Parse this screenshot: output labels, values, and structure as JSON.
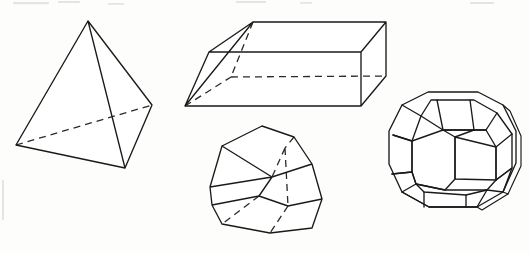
{
  "figure": {
    "background_color": "#fdfdfc",
    "stroke_color": "#1a1a1a",
    "canvas": {
      "width": 530,
      "height": 253
    },
    "caption": "",
    "shapes": [
      {
        "id": "tetrahedron",
        "name": "Tetrahedron",
        "label": "",
        "vertices": {
          "apex": [
            88,
            21
          ],
          "left": [
            16,
            145
          ],
          "right": [
            152,
            105
          ],
          "bottom_front": [
            125,
            168
          ]
        },
        "solid_edges": [
          [
            "apex",
            "left"
          ],
          [
            "apex",
            "right"
          ],
          [
            "apex",
            "bottom_front"
          ],
          [
            "left",
            "bottom_front"
          ],
          [
            "right",
            "bottom_front"
          ]
        ],
        "hidden_edges": [
          [
            "left",
            "right"
          ]
        ]
      },
      {
        "id": "parallelepiped",
        "name": "Oblique parallelepiped",
        "label": "",
        "vertices": {
          "front_top_left": [
            209,
            52
          ],
          "front_top_right": [
            361,
            52
          ],
          "front_bottom_left": [
            185,
            106
          ],
          "front_bottom_right": [
            361,
            106
          ],
          "back_top_left": [
            253,
            22
          ],
          "back_top_right": [
            386,
            22
          ],
          "back_bottom_left": [
            231,
            77
          ],
          "back_bottom_right": [
            386,
            76
          ]
        },
        "solid_edges": [
          [
            "front_top_left",
            "front_top_right"
          ],
          [
            "front_bottom_left",
            "front_bottom_right"
          ],
          [
            "front_top_left",
            "front_bottom_left"
          ],
          [
            "front_top_right",
            "front_bottom_right"
          ],
          [
            "back_top_left",
            "back_top_right"
          ],
          [
            "back_top_left",
            "front_top_left"
          ],
          [
            "back_top_right",
            "front_top_right"
          ],
          [
            "back_top_right",
            "back_bottom_right"
          ],
          [
            "back_bottom_right",
            "front_bottom_right"
          ],
          [
            "front_bottom_left",
            "back_top_left"
          ]
        ],
        "hidden_edges": [
          [
            "back_bottom_left",
            "back_bottom_right"
          ],
          [
            "back_top_left",
            "back_bottom_left"
          ],
          [
            "front_bottom_left",
            "back_bottom_left"
          ]
        ]
      },
      {
        "id": "dodecahedron",
        "name": "Irregular dodecahedron",
        "label": "",
        "vertices": {
          "top": [
            262,
            126
          ],
          "top_right": [
            294,
            137
          ],
          "upper_left": [
            222,
            146
          ],
          "mid_left": [
            210,
            187
          ],
          "right_upper": [
            312,
            164
          ],
          "right_mid": [
            322,
            199
          ],
          "center_mid": [
            272,
            177
          ],
          "left_low": [
            212,
            205
          ],
          "low_mid": [
            259,
            196
          ],
          "bottom_left": [
            222,
            224
          ],
          "bottom_mid": [
            270,
            233
          ],
          "bottom_right": [
            312,
            228
          ],
          "hidden_a": [
            285,
            148
          ],
          "hidden_b": [
            288,
            206
          ]
        },
        "solid_edges": [
          [
            "top",
            "upper_left"
          ],
          [
            "top",
            "top_right"
          ],
          [
            "upper_left",
            "mid_left"
          ],
          [
            "mid_left",
            "left_low"
          ],
          [
            "top_right",
            "right_upper"
          ],
          [
            "right_upper",
            "right_mid"
          ],
          [
            "right_mid",
            "bottom_right"
          ],
          [
            "bottom_left",
            "bottom_mid"
          ],
          [
            "bottom_mid",
            "bottom_right"
          ],
          [
            "left_low",
            "bottom_left"
          ],
          [
            "mid_left",
            "center_mid"
          ],
          [
            "center_mid",
            "low_mid"
          ],
          [
            "low_mid",
            "left_low"
          ],
          [
            "upper_left",
            "center_mid"
          ],
          [
            "right_mid",
            "hidden_b"
          ],
          [
            "hidden_b",
            "low_mid"
          ],
          [
            "center_mid",
            "right_upper"
          ]
        ],
        "hidden_edges": [
          [
            "top_right",
            "hidden_a"
          ],
          [
            "hidden_a",
            "center_mid"
          ],
          [
            "hidden_a",
            "hidden_b"
          ],
          [
            "hidden_b",
            "bottom_mid"
          ],
          [
            "low_mid",
            "bottom_left"
          ]
        ]
      },
      {
        "id": "truncated_cuboctahedron",
        "name": "Truncated cuboctahedron",
        "label": "",
        "center": [
          453,
          146
        ],
        "outline_radius": 75,
        "face_count_visible": 13
      }
    ]
  }
}
